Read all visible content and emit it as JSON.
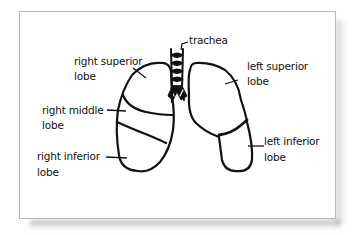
{
  "diagram": {
    "labels": {
      "trachea": "trachea",
      "right_superior_line1": "right superior",
      "right_superior_line2": "lobe",
      "right_middle_line1": "right middle",
      "right_middle_line2": "lobe",
      "right_inferior_line1": "right inferior",
      "right_inferior_line2": "lobe",
      "left_superior_line1": "left superior",
      "left_superior_line2": "lobe",
      "left_inferior_line1": "left inferior",
      "left_inferior_line2": "lobe"
    },
    "colors": {
      "stroke": "#111111",
      "card_border": "#b8b8b8",
      "background": "#ffffff"
    }
  }
}
